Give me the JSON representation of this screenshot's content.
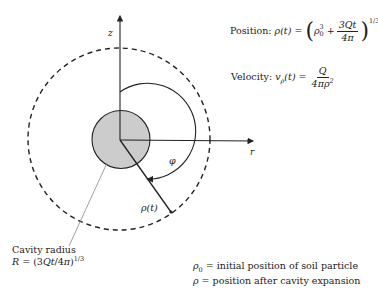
{
  "diagram": {
    "axes": {
      "z_label": "z",
      "r_label": "r",
      "phi_label": "φ",
      "rho_label": "ρ(t)"
    },
    "equations": {
      "position": {
        "label": "Position:",
        "lhs": "ρ(t) =",
        "rho0": "ρ",
        "rho0_sub": "0",
        "rho0_sup": "3",
        "plus": "+",
        "numerator": "3Qt",
        "denominator": "4π",
        "exponent": "1/3",
        "open_paren": "(",
        "close_paren": ")"
      },
      "velocity": {
        "label": "Velocity:",
        "lhs_v": "v",
        "lhs_sub": "ρ",
        "lhs_rest": "(t) =",
        "numerator": "Q",
        "denominator": "4πρ",
        "denominator_sup": "2"
      }
    },
    "cavity_annotation": {
      "title": "Cavity radius",
      "formula_R": "R",
      "formula_eq": " = (3",
      "formula_Qt": "Qt",
      "formula_mid": "/4",
      "formula_pi": "π",
      "formula_close": ")",
      "formula_exp": "1/3"
    },
    "legend": [
      {
        "symbol": "ρ",
        "sub": "0",
        "text": " = initial position of soil particle"
      },
      {
        "symbol": "ρ",
        "sub": "",
        "text": " = position after cavity expansion"
      }
    ],
    "colors": {
      "stroke": "#222222",
      "cavity_fill": "#cccccc",
      "leader_line": "#888888"
    }
  }
}
